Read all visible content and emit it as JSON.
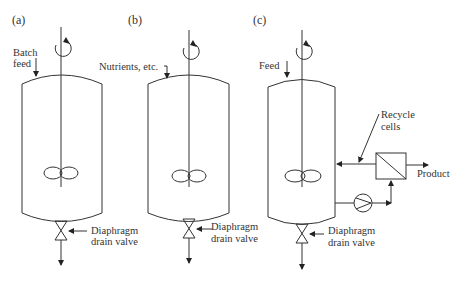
{
  "panels": [
    {
      "id": "a",
      "label": "(a)",
      "feed_label_1": "Batch",
      "feed_label_2": "feed",
      "valve_label_1": "Diaphragm",
      "valve_label_2": "drain valve"
    },
    {
      "id": "b",
      "label": "(b)",
      "feed_label": "Nutrients, etc.",
      "valve_label_1": "Diaphragm",
      "valve_label_2": "drain valve"
    },
    {
      "id": "c",
      "label": "(c)",
      "feed_label": "Feed",
      "recycle_label_1": "Recycle",
      "recycle_label_2": "cells",
      "product_label": "Product",
      "valve_label_1": "Diaphragm",
      "valve_label_2": "drain valve"
    }
  ],
  "colors": {
    "line": "#333333",
    "text": "#333333",
    "background": "#ffffff"
  }
}
